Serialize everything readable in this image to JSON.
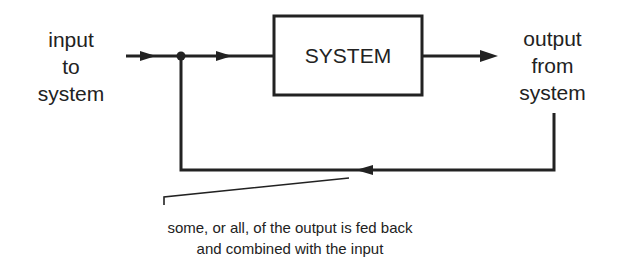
{
  "diagram": {
    "type": "feedback-loop",
    "input_label": [
      "input",
      "to",
      "system"
    ],
    "system_label": "SYSTEM",
    "output_label": [
      "output",
      "from",
      "system"
    ],
    "annotation": [
      "some, or all, of the output is fed back",
      "and combined with the input"
    ],
    "colors": {
      "line": "#222222",
      "background": "#ffffff"
    }
  }
}
